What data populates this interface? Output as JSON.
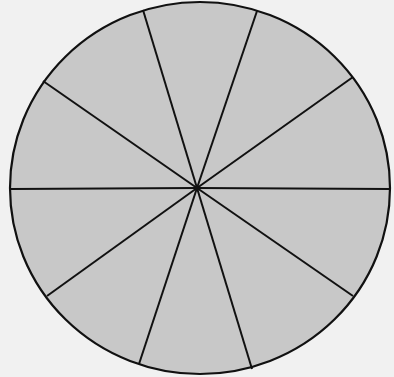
{
  "diagram": {
    "type": "circle-divided-into-sectors",
    "sector_count": 10,
    "fill_color": "#c8c8c8",
    "stroke_color": "#111111",
    "background_color": "#f1f1f1",
    "center": [
      197,
      188
    ],
    "radius_x": 190,
    "radius_y": 186,
    "spoke_endpoints": [
      [
        143,
        10
      ],
      [
        257,
        11
      ],
      [
        353,
        77
      ],
      [
        390,
        189
      ],
      [
        353,
        296
      ],
      [
        252,
        369
      ],
      [
        139,
        364
      ],
      [
        47,
        296
      ],
      [
        11,
        189
      ],
      [
        43,
        81
      ]
    ]
  }
}
